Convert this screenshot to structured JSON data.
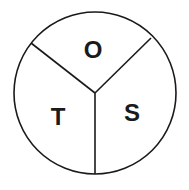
{
  "diagram": {
    "type": "circle-divided-three-sectors",
    "stroke_color": "#1a1a1a",
    "background": "#ffffff",
    "sectors": [
      {
        "position": "top",
        "label": "O"
      },
      {
        "position": "bottom-left",
        "label": "T"
      },
      {
        "position": "bottom-right",
        "label": "S"
      }
    ]
  }
}
